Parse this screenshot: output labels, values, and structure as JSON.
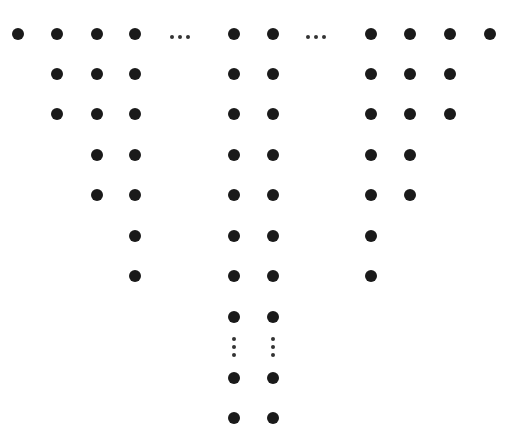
{
  "diagram": {
    "dot_color": "#1a1a1a",
    "columns": [
      {
        "x": 18,
        "rows": [
          34
        ]
      },
      {
        "x": 57,
        "rows": [
          34,
          74,
          114
        ]
      },
      {
        "x": 97,
        "rows": [
          34,
          74,
          114,
          155,
          195
        ]
      },
      {
        "x": 135,
        "rows": [
          34,
          74,
          114,
          155,
          195,
          236,
          276
        ]
      },
      {
        "x": 234,
        "rows": [
          34,
          74,
          114,
          155,
          195,
          236,
          276,
          317,
          378,
          418
        ]
      },
      {
        "x": 273,
        "rows": [
          34,
          74,
          114,
          155,
          195,
          236,
          276,
          317,
          378,
          418
        ]
      },
      {
        "x": 371,
        "rows": [
          34,
          74,
          114,
          155,
          195,
          236,
          276
        ]
      },
      {
        "x": 410,
        "rows": [
          34,
          74,
          114,
          155,
          195
        ]
      },
      {
        "x": 450,
        "rows": [
          34,
          74,
          114
        ]
      },
      {
        "x": 490,
        "rows": [
          34
        ]
      }
    ],
    "horizontal_ellipses": [
      {
        "x": 180,
        "y": 37
      },
      {
        "x": 316,
        "y": 37
      }
    ],
    "vertical_ellipses": [
      {
        "x": 234,
        "y": 347
      },
      {
        "x": 273,
        "y": 347
      }
    ]
  }
}
